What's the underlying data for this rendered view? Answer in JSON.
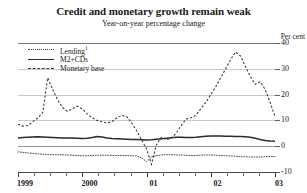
{
  "chart_data": {
    "type": "line",
    "title": "Credit and monetary growth remain weak",
    "subtitle": "Year-on-year percentage change",
    "ylabel": "Per cent",
    "xlabel": "",
    "ylim": [
      -10,
      40
    ],
    "yticks": [
      40,
      30,
      20,
      10,
      0,
      -10
    ],
    "ytick_labels": [
      "40",
      "30",
      "20",
      "10",
      "0",
      "-10"
    ],
    "grid": true,
    "legend_position": "top-left",
    "x": [
      1999.0,
      1999.083,
      1999.167,
      1999.25,
      1999.333,
      1999.417,
      1999.5,
      1999.583,
      1999.667,
      1999.75,
      1999.833,
      1999.917,
      2000.0,
      2000.083,
      2000.167,
      2000.25,
      2000.333,
      2000.417,
      2000.5,
      2000.583,
      2000.667,
      2000.75,
      2000.833,
      2000.917,
      2001.0,
      2001.083,
      2001.167,
      2001.25,
      2001.333,
      2001.417,
      2001.5,
      2001.583,
      2001.667,
      2001.75,
      2001.833,
      2001.917,
      2002.0,
      2002.083,
      2002.167,
      2002.25,
      2002.333,
      2002.417,
      2002.5,
      2002.583,
      2002.667,
      2002.75,
      2002.833,
      2002.917,
      2003.0,
      2003.083,
      2003.167,
      2003.25,
      2003.333
    ],
    "xtick_labels": [
      "1999",
      "2000",
      "01",
      "02",
      "03"
    ],
    "xtick_values": [
      1999.0,
      2000.0,
      2001.0,
      2002.0,
      2003.0
    ],
    "series": [
      {
        "name": "Lending",
        "name_display": "Lending",
        "footnote_marker": "1",
        "style": "fine-dotted",
        "color": "#3a3a3a",
        "values": [
          -2.2,
          -2.4,
          -2.6,
          -2.8,
          -3.0,
          -3.1,
          -3.2,
          -3.3,
          -3.3,
          -3.3,
          -3.4,
          -3.5,
          -3.6,
          -3.7,
          -3.7,
          -3.6,
          -3.5,
          -3.5,
          -3.5,
          -3.6,
          -3.6,
          -3.6,
          -3.6,
          -3.7,
          -3.8,
          -4.5,
          -6.0,
          -4.2,
          -3.6,
          -3.4,
          -3.3,
          -3.3,
          -3.4,
          -3.4,
          -3.5,
          -3.6,
          -3.6,
          -3.5,
          -3.4,
          -3.4,
          -3.5,
          -3.6,
          -3.7,
          -3.8,
          -3.9,
          -4.0,
          -4.1,
          -4.2,
          -4.2,
          -4.2,
          -4.1,
          -4.0,
          -4.0
        ]
      },
      {
        "name": "M2+CDs",
        "name_display": "M2+CDs",
        "style": "solid",
        "color": "#2a2a2a",
        "values": [
          3.2,
          3.4,
          3.5,
          3.6,
          3.7,
          3.6,
          3.5,
          3.4,
          3.3,
          3.2,
          3.2,
          3.2,
          3.1,
          3.0,
          3.1,
          3.4,
          3.8,
          3.6,
          3.2,
          3.0,
          2.9,
          2.8,
          2.7,
          2.6,
          2.6,
          2.5,
          2.4,
          2.5,
          2.7,
          2.9,
          3.1,
          3.3,
          3.5,
          3.5,
          3.4,
          3.4,
          3.5,
          3.7,
          3.9,
          4.0,
          4.0,
          4.0,
          3.9,
          3.9,
          3.8,
          3.8,
          3.7,
          3.5,
          3.1,
          2.6,
          2.2,
          2.0,
          1.9
        ]
      },
      {
        "name": "Monetary base",
        "name_display": "Monetary base",
        "style": "dashed",
        "color": "#3a3a3a",
        "values": [
          8.5,
          7.8,
          8.0,
          9.5,
          11.0,
          13.0,
          26.5,
          22.0,
          18.0,
          15.0,
          13.5,
          14.5,
          15.5,
          14.5,
          12.5,
          11.0,
          10.0,
          9.5,
          9.0,
          9.5,
          11.0,
          12.0,
          11.5,
          9.0,
          6.0,
          2.5,
          -1.0,
          -7.0,
          0.5,
          3.5,
          2.5,
          3.0,
          5.0,
          8.0,
          10.5,
          11.0,
          12.0,
          14.5,
          17.0,
          20.0,
          23.0,
          26.5,
          30.0,
          33.5,
          36.5,
          35.0,
          31.0,
          27.0,
          24.0,
          25.0,
          22.0,
          17.0,
          11.5
        ]
      }
    ]
  }
}
